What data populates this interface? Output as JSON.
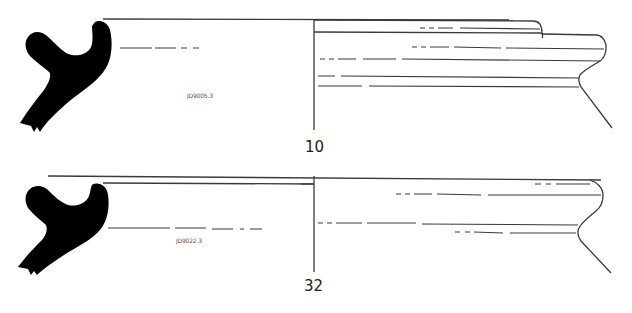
{
  "figure": {
    "type": "pottery-rim-profiles",
    "colors": {
      "section_fill": "#000000",
      "line": "#3a3a3a",
      "background": "#ffffff"
    },
    "drawings": [
      {
        "number": "10",
        "inventory_label": "JD9005.3"
      },
      {
        "number": "32",
        "inventory_label": "JD9022.3"
      }
    ]
  }
}
